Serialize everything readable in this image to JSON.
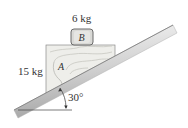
{
  "figure": {
    "block_b": {
      "letter": "B",
      "mass_label": "6 kg"
    },
    "block_a": {
      "letter": "A",
      "mass_label": "15 kg"
    },
    "incline": {
      "angle_label": "30°"
    }
  },
  "colors": {
    "incline_light": "#f2f2f2",
    "incline_dark": "#9a9a9a",
    "block_fill": "#eeeeea",
    "block_b_fill": "#d9d9d6",
    "outline": "#555555"
  }
}
